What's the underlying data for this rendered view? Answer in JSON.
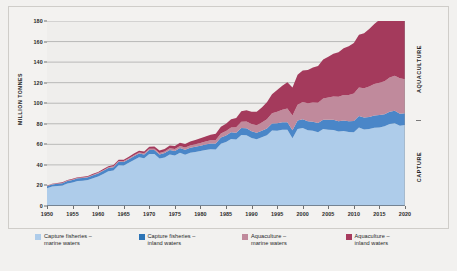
{
  "chart_data": {
    "type": "area",
    "stacked": true,
    "title": "",
    "subtitle": "",
    "xlabel": "",
    "ylabel": "MILLION TONNES",
    "xlim": [
      1950,
      2020
    ],
    "ylim": [
      0,
      180
    ],
    "ytick_step": 20,
    "xtick_step": 5,
    "grid": "horizontal",
    "legend_position": "bottom",
    "yticks": [
      0,
      20,
      40,
      60,
      80,
      100,
      120,
      140,
      160,
      180
    ],
    "xticks": [
      1950,
      1955,
      1960,
      1965,
      1970,
      1975,
      1980,
      1985,
      1990,
      1995,
      2000,
      2005,
      2010,
      2015,
      2020
    ],
    "x": [
      1950,
      1951,
      1952,
      1953,
      1954,
      1955,
      1956,
      1957,
      1958,
      1959,
      1960,
      1961,
      1962,
      1963,
      1964,
      1965,
      1966,
      1967,
      1968,
      1969,
      1970,
      1971,
      1972,
      1973,
      1974,
      1975,
      1976,
      1977,
      1978,
      1979,
      1980,
      1981,
      1982,
      1983,
      1984,
      1985,
      1986,
      1987,
      1988,
      1989,
      1990,
      1991,
      1992,
      1993,
      1994,
      1995,
      1996,
      1997,
      1998,
      1999,
      2000,
      2001,
      2002,
      2003,
      2004,
      2005,
      2006,
      2007,
      2008,
      2009,
      2010,
      2011,
      2012,
      2013,
      2014,
      2015,
      2016,
      2017,
      2018,
      2019,
      2020
    ],
    "series": [
      {
        "name": "Capture fisheries – marine waters",
        "color": "#aeccea",
        "values": [
          17.2,
          19.0,
          19.5,
          19.9,
          22.0,
          22.9,
          24.4,
          24.6,
          25.2,
          27.1,
          28.8,
          31.2,
          33.8,
          34.6,
          39.7,
          39.4,
          42.1,
          44.8,
          47.4,
          46.4,
          50.6,
          50.5,
          46.1,
          47.3,
          50.1,
          49.1,
          51.9,
          49.9,
          51.7,
          52.6,
          53.5,
          54.4,
          55.1,
          54.9,
          60.6,
          62.3,
          65.2,
          64.6,
          69.1,
          68.9,
          66.2,
          64.9,
          66.9,
          68.9,
          73.4,
          73.2,
          74.1,
          74.1,
          66.0,
          74.9,
          75.8,
          73.7,
          73.2,
          71.8,
          74.8,
          74.3,
          74.0,
          72.4,
          73.0,
          72.0,
          71.7,
          76.4,
          74.4,
          75.0,
          76.2,
          76.5,
          77.6,
          79.9,
          80.6,
          78.2,
          78.8
        ]
      },
      {
        "name": "Capture fisheries – inland waters",
        "color": "#4a86c8",
        "values": [
          1.9,
          2.0,
          2.1,
          2.2,
          2.3,
          2.4,
          2.5,
          2.6,
          2.7,
          2.8,
          2.9,
          3.0,
          3.1,
          3.2,
          3.3,
          3.4,
          3.5,
          3.6,
          3.7,
          3.8,
          3.9,
          4.0,
          4.1,
          4.2,
          4.4,
          4.5,
          4.6,
          4.8,
          4.9,
          5.0,
          5.2,
          5.4,
          5.6,
          5.8,
          6.0,
          6.2,
          6.5,
          6.7,
          6.9,
          6.8,
          6.6,
          6.3,
          6.3,
          6.6,
          6.8,
          7.2,
          7.4,
          7.5,
          7.8,
          8.2,
          8.7,
          8.7,
          8.8,
          9.0,
          9.2,
          9.6,
          9.9,
          10.1,
          10.3,
          10.5,
          11.0,
          11.2,
          11.6,
          11.7,
          11.9,
          12.0,
          11.6,
          11.9,
          12.0,
          11.6,
          11.5
        ]
      },
      {
        "name": "Aquaculture – marine waters",
        "color": "#c08a9c",
        "values": [
          0.3,
          0.3,
          0.4,
          0.4,
          0.4,
          0.5,
          0.5,
          0.5,
          0.6,
          0.6,
          0.6,
          0.7,
          0.7,
          0.8,
          0.8,
          0.9,
          0.9,
          1.0,
          1.0,
          1.1,
          1.2,
          1.3,
          1.4,
          1.5,
          1.6,
          1.8,
          1.9,
          2.1,
          2.3,
          2.5,
          2.7,
          3.0,
          3.3,
          3.6,
          4.0,
          4.4,
          4.8,
          5.4,
          6.0,
          6.5,
          6.9,
          7.4,
          8.1,
          9.0,
          10.0,
          11.2,
          12.2,
          13.2,
          14.2,
          15.3,
          16.6,
          17.6,
          18.6,
          19.6,
          20.7,
          21.6,
          22.7,
          23.7,
          24.7,
          25.6,
          26.7,
          27.7,
          28.6,
          29.6,
          30.5,
          31.4,
          32.3,
          33.2,
          34.1,
          34.6,
          33.1
        ]
      },
      {
        "name": "Aquaculture – inland waters",
        "color": "#a43a5c",
        "values": [
          0.3,
          0.4,
          0.4,
          0.5,
          0.5,
          0.6,
          0.6,
          0.7,
          0.7,
          0.8,
          0.9,
          1.0,
          1.1,
          1.2,
          1.3,
          1.4,
          1.5,
          1.6,
          1.7,
          1.8,
          2.0,
          2.1,
          2.3,
          2.5,
          2.7,
          3.0,
          3.2,
          3.5,
          3.8,
          4.1,
          4.5,
          4.9,
          5.4,
          5.9,
          6.5,
          7.2,
          8.0,
          9.0,
          10.1,
          11.0,
          11.9,
          13.0,
          14.5,
          16.4,
          18.6,
          21.2,
          23.4,
          25.5,
          27.3,
          29.3,
          30.8,
          32.4,
          34.1,
          35.9,
          37.8,
          39.7,
          41.6,
          43.5,
          45.4,
          47.3,
          49.2,
          51.3,
          53.5,
          55.8,
          58.4,
          61.3,
          64.0,
          67.2,
          70.2,
          72.8,
          73.9
        ]
      }
    ],
    "annotations": {
      "right_upper": "AQUACULTURE",
      "right_lower": "CAPTURE"
    }
  },
  "axes": {
    "y_title": "MILLION TONNES",
    "y_labels": [
      "180",
      "160",
      "140",
      "120",
      "100",
      "80",
      "60",
      "40",
      "20",
      "0"
    ],
    "x_labels": [
      "1950",
      "1955",
      "1960",
      "1965",
      "1970",
      "1975",
      "1980",
      "1985",
      "1990",
      "1995",
      "2000",
      "2005",
      "2010",
      "2015",
      "2020"
    ]
  },
  "side_labels": {
    "aquaculture": "AQUACULTURE",
    "capture": "CAPTURE"
  },
  "legend": {
    "items": [
      {
        "label": "Capture fisheries –\nmarine waters",
        "color": "#aeccea"
      },
      {
        "label": "Capture fisheries –\ninland waters",
        "color": "#2e75b6"
      },
      {
        "label": "Aquaculture –\nmarine waters",
        "color": "#c08a9c"
      },
      {
        "label": "Aquaculture –\ninland waters",
        "color": "#a83b5e"
      }
    ]
  },
  "colors": {
    "page_background": "#f2f1ef",
    "panel_background": "#f3f2f0",
    "plot_background": "#efeeec",
    "gridline": "#8d8d8d",
    "axis": "#3a3a3a",
    "text": "#222222"
  }
}
